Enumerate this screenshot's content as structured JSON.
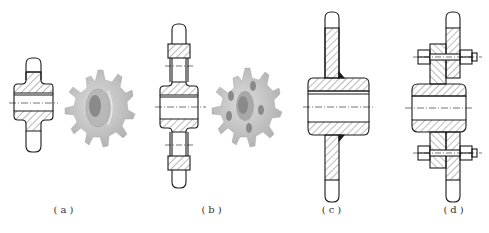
{
  "figure": {
    "panels": [
      {
        "id": "a",
        "caption": "(a)",
        "description": "Solid integral sprocket, section view and 3D render",
        "center_x": 50
      },
      {
        "id": "b",
        "caption": "(b)",
        "description": "Sprocket with lightening holes (web type), section view and 3D render",
        "center_x": 183
      },
      {
        "id": "c",
        "caption": "(c)",
        "description": "Welded sprocket: plate welded to hub",
        "center_x": 333
      },
      {
        "id": "d",
        "caption": "(d)",
        "description": "Assembled sprocket: ring gear bolted to hub flange",
        "center_x": 455
      }
    ]
  },
  "colors": {
    "line": "#1a1a1a",
    "hatch": "#3a3a3a",
    "render_body": "#c8c8c8",
    "render_shadow": "#9a9a9a",
    "render_bore": "#8a8a8a",
    "caption": "#333333"
  }
}
